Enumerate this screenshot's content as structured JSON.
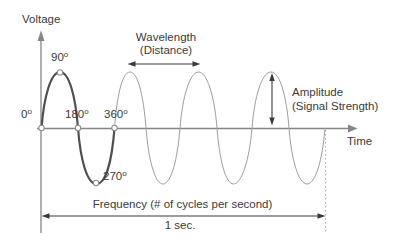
{
  "colors": {
    "background": "#ffffff",
    "text": "#3a3a3a",
    "axis": "#858585",
    "wave_primary": "#4f4f4f",
    "wave_secondary": "#9e9e9e",
    "marker_stroke": "#8f8f8f",
    "marker_fill": "#ffffff",
    "arrow": "#3a3a3a",
    "dotted_line": "#aaaaaa"
  },
  "axes": {
    "y_label": "Voltage",
    "x_label": "Time"
  },
  "annotations": {
    "wavelength": {
      "line1": "Wavelength",
      "line2": "(Distance)"
    },
    "amplitude": {
      "line1": "Amplitude",
      "line2": "(Signal Strength)"
    },
    "frequency": {
      "label": "Frequency (# of cycles per second)",
      "duration": "1 sec."
    }
  },
  "degree_markers": [
    {
      "value": "0",
      "sup": "o"
    },
    {
      "value": "90",
      "sup": "o"
    },
    {
      "value": "180",
      "sup": "o"
    },
    {
      "value": "270",
      "sup": "o"
    },
    {
      "value": "360",
      "sup": "o"
    }
  ]
}
